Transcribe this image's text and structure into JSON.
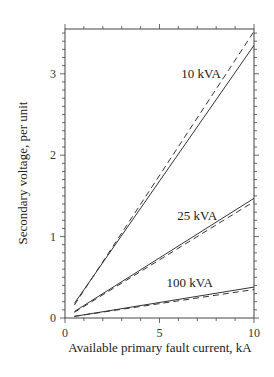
{
  "chart_data": {
    "type": "line",
    "title": "",
    "xlabel": "Available primary fault current, kA",
    "ylabel": "Secondary voltage, per unit",
    "xlim": [
      0,
      10
    ],
    "ylim": [
      0,
      3.55
    ],
    "x_ticks": [
      "0",
      "5",
      "10"
    ],
    "y_ticks": [
      "0",
      "1",
      "2",
      "3"
    ],
    "grid": false,
    "legend": "inline labels",
    "series": [
      {
        "name": "10 kVA",
        "style": "solid",
        "x": [
          0.5,
          10
        ],
        "y": [
          0.18,
          3.35
        ]
      },
      {
        "name": "10 kVA",
        "style": "dashed",
        "x": [
          0.5,
          10
        ],
        "y": [
          0.16,
          3.52
        ]
      },
      {
        "name": "25 kVA",
        "style": "solid",
        "x": [
          0.5,
          10
        ],
        "y": [
          0.08,
          1.47
        ]
      },
      {
        "name": "25 kVA",
        "style": "dashed",
        "x": [
          0.5,
          10
        ],
        "y": [
          0.07,
          1.43
        ]
      },
      {
        "name": "100 kVA",
        "style": "solid",
        "x": [
          0.5,
          10
        ],
        "y": [
          0.02,
          0.38
        ]
      },
      {
        "name": "100 kVA",
        "style": "dashed",
        "x": [
          0.5,
          10
        ],
        "y": [
          0.02,
          0.35
        ]
      }
    ],
    "annotations": [
      {
        "text": "10 kVA",
        "x": 7.2,
        "y": 2.95
      },
      {
        "text": "25 kVA",
        "x": 7.0,
        "y": 1.2
      },
      {
        "text": "100 kVA",
        "x": 6.6,
        "y": 0.38
      }
    ]
  }
}
